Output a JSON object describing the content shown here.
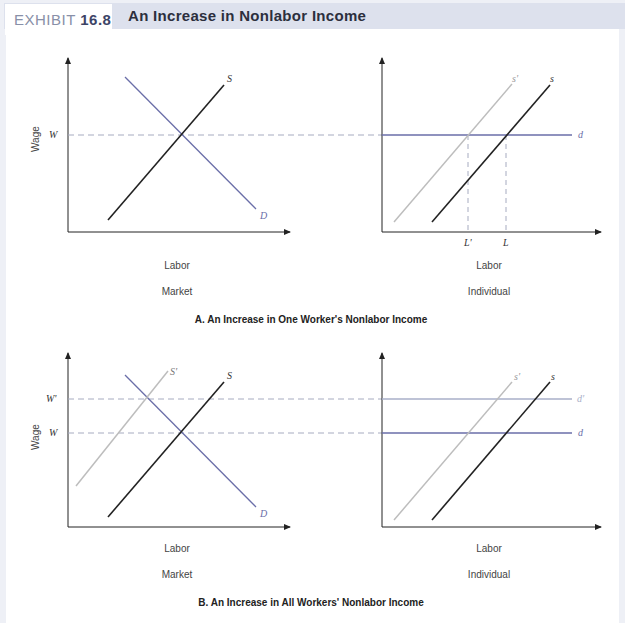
{
  "header": {
    "exhibit_prefix": "EXHIBIT ",
    "exhibit_number": "16.8",
    "title": "An Increase in Nonlabor Income"
  },
  "colors": {
    "header_bg": "#dde1ed",
    "supply": "#222222",
    "shifted_supply": "#bdbdbd",
    "demand": "#6a6ea8",
    "shifted_demand": "#a9afc9",
    "dashed": "#a6abc0"
  },
  "panel_a": {
    "caption": "A. An Increase in One Worker's Nonlabor Income",
    "market": {
      "y_axis": "Wage",
      "x_axis": "Labor",
      "subtitle": "Market",
      "wage_label": "W",
      "supply_label": "S",
      "demand_label": "D"
    },
    "individual": {
      "x_axis": "Labor",
      "subtitle": "Individual",
      "supply_label": "s",
      "shifted_supply_label": "s'",
      "demand_label": "d",
      "labor_label": "L",
      "shifted_labor_label": "L'"
    }
  },
  "panel_b": {
    "caption": "B. An Increase in All  Workers' Nonlabor Income",
    "market": {
      "y_axis": "Wage",
      "x_axis": "Labor",
      "subtitle": "Market",
      "wage_label": "W",
      "shifted_wage_label": "W'",
      "supply_label": "S",
      "shifted_supply_label": "S'",
      "demand_label": "D"
    },
    "individual": {
      "x_axis": "Labor",
      "subtitle": "Individual",
      "supply_label": "s",
      "shifted_supply_label": "s'",
      "demand_label": "d",
      "shifted_demand_label": "d'"
    }
  }
}
